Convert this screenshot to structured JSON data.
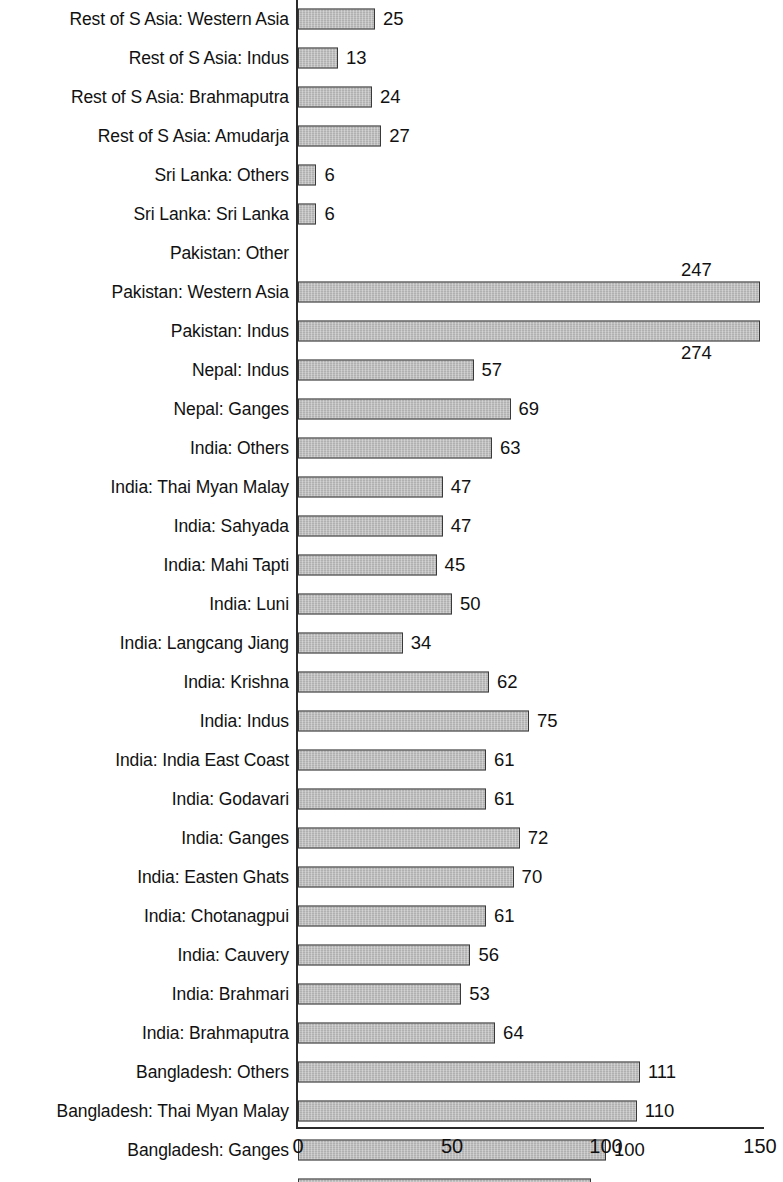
{
  "chart_data": {
    "type": "bar",
    "orientation": "horizontal",
    "title": "",
    "subtitle": "",
    "xlabel": "",
    "ylabel": "",
    "xlim": [
      0,
      150
    ],
    "xticks": [
      0,
      50,
      100,
      150
    ],
    "xtick_labels": [
      "0",
      "50",
      "100",
      "150"
    ],
    "grid": false,
    "legend": null,
    "bar_color": "#b9b9b9",
    "bar_edge_color": "#3a3a3a",
    "axis_color": "#2b2b2b",
    "note": "Bars for Pakistan: Western Asia (247) and Pakistan: Indus (274) exceed the axis maximum of 150 and are clipped at the plot edge; their value labels are displaced vertically.",
    "categories": [
      "Rest of S Asia: Western Asia",
      "Rest of S Asia: Indus",
      "Rest of S Asia: Brahmaputra",
      "Rest of S Asia: Amudarja",
      "Sri Lanka: Others",
      "Sri Lanka: Sri Lanka",
      "Pakistan: Other",
      "Pakistan: Western Asia",
      "Pakistan: Indus",
      "Nepal: Indus",
      "Nepal: Ganges",
      "India: Others",
      "India: Thai Myan Malay",
      "India: Sahyada",
      "India: Mahi Tapti",
      "India: Luni",
      "India: Langcang Jiang",
      "India: Krishna",
      "India: Indus",
      "India: India East Coast",
      "India: Godavari",
      "India: Ganges",
      "India: Easten Ghats",
      "India: Chotanagpui",
      "India: Cauvery",
      "India: Brahmari",
      "India: Brahmaputra",
      "Bangladesh: Others",
      "Bangladesh: Thai Myan Malay",
      "Bangladesh: Ganges",
      "Bangladesh: Brahmaputra"
    ],
    "values": [
      25,
      13,
      24,
      27,
      6,
      6,
      0,
      247,
      274,
      57,
      69,
      63,
      47,
      47,
      45,
      50,
      34,
      62,
      75,
      61,
      61,
      72,
      70,
      61,
      56,
      53,
      64,
      111,
      110,
      100,
      95
    ],
    "value_labels": [
      "25",
      "13",
      "24",
      "27",
      "6",
      "6",
      "",
      "247",
      "274",
      "57",
      "69",
      "63",
      "47",
      "47",
      "45",
      "50",
      "34",
      "62",
      "75",
      "61",
      "61",
      "72",
      "70",
      "61",
      "56",
      "53",
      "64",
      "111",
      "110",
      "100",
      "95"
    ]
  }
}
